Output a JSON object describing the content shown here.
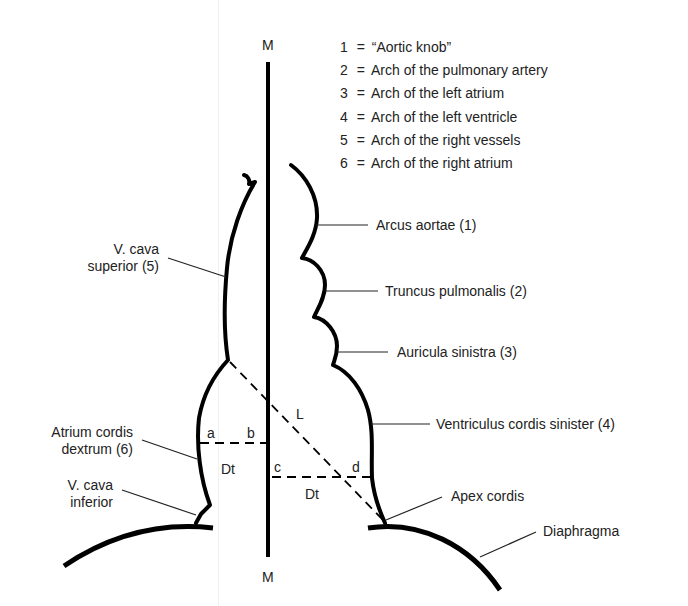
{
  "diagram": {
    "midline_label_top": "M",
    "midline_label_bottom": "M",
    "legend": [
      {
        "num": "1",
        "eq": "=",
        "text": "“Aortic knob”"
      },
      {
        "num": "2",
        "eq": "=",
        "text": "Arch of the pulmonary artery"
      },
      {
        "num": "3",
        "eq": "=",
        "text": "Arch of the left atrium"
      },
      {
        "num": "4",
        "eq": "=",
        "text": "Arch of the left ventricle"
      },
      {
        "num": "5",
        "eq": "=",
        "text": "Arch of the right vessels"
      },
      {
        "num": "6",
        "eq": "=",
        "text": "Arch of the right atrium"
      }
    ],
    "right_labels": {
      "arcus_aortae": "Arcus aortae (1)",
      "truncus_pulmonalis": "Truncus pulmonalis (2)",
      "auricula_sinistra": "Auricula sinistra (3)",
      "ventriculus": "Ventriculus cordis sinister (4)",
      "apex": "Apex cordis",
      "diaphragma": "Diaphragma"
    },
    "left_labels": {
      "vcs_line1": "V. cava",
      "vcs_line2": "superior (5)",
      "atrium_line1": "Atrium cordis",
      "atrium_line2": "dextrum (6)",
      "vci_line1": "V. cava",
      "vci_line2": "inferior"
    },
    "measure_labels": {
      "a": "a",
      "b": "b",
      "c": "c",
      "d": "d",
      "dt_left": "Dt",
      "dt_right": "Dt",
      "L": "L"
    },
    "colors": {
      "stroke": "#000000",
      "text": "#222222",
      "background": "#ffffff"
    }
  }
}
